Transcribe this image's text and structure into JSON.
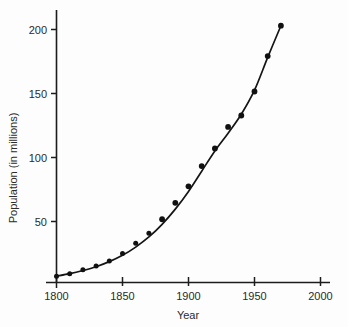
{
  "chart_data": {
    "type": "scatter",
    "title": "",
    "subtitle": "",
    "xlabel": "Year",
    "ylabel": "Population (in millions)",
    "xlim": [
      1795,
      2010
    ],
    "ylim": [
      0,
      212
    ],
    "grid": false,
    "legend": null,
    "x_ticks": [
      1800,
      1850,
      1900,
      1950,
      2000
    ],
    "x_tick_labels": [
      "1800",
      "1850",
      "1900",
      "1950",
      "2000"
    ],
    "y_ticks": [
      50,
      100,
      150,
      200
    ],
    "y_tick_labels": [
      "50",
      "100",
      "150",
      "200"
    ],
    "series": [
      {
        "name": "Population data points",
        "marker": "filled-circle",
        "color": "#111111",
        "x": [
          1800,
          1810,
          1820,
          1830,
          1840,
          1850,
          1860,
          1870,
          1880,
          1890,
          1900,
          1910,
          1920,
          1930,
          1940,
          1950,
          1960,
          1970
        ],
        "values": [
          5,
          7,
          10,
          13,
          17,
          23,
          31,
          39,
          50,
          63,
          76,
          92,
          106,
          123,
          132,
          151,
          179,
          203
        ]
      },
      {
        "name": "Fitted exponential curve",
        "marker": "none",
        "color": "#151515",
        "x": [
          1800,
          1810,
          1820,
          1830,
          1840,
          1850,
          1860,
          1870,
          1880,
          1890,
          1900,
          1910,
          1920,
          1930,
          1940,
          1950,
          1960,
          1970
        ],
        "values": [
          5,
          7,
          9.5,
          12.5,
          16.5,
          21.5,
          28,
          36,
          46,
          58,
          72,
          88,
          104,
          118,
          133,
          152,
          178,
          203
        ]
      }
    ]
  },
  "axes": {
    "y_axis_name": "population-axis",
    "x_axis_name": "year-axis"
  }
}
